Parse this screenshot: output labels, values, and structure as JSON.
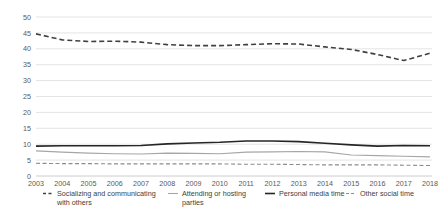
{
  "chart_data": {
    "type": "line",
    "title": "",
    "subtitle": "",
    "xlabel": "",
    "ylabel": "",
    "x": [
      2003,
      2004,
      2005,
      2006,
      2007,
      2008,
      2009,
      2010,
      2011,
      2012,
      2013,
      2014,
      2015,
      2016,
      2017,
      2018
    ],
    "categories": [
      "2003",
      "2004",
      "2005",
      "2006",
      "2007",
      "2008",
      "2009",
      "2010",
      "2011",
      "2012",
      "2013",
      "2014",
      "2015",
      "2016",
      "2017",
      "2018"
    ],
    "xlim": [
      2003,
      2018
    ],
    "ylim": [
      0,
      50
    ],
    "yticks": [
      0,
      5,
      10,
      15,
      20,
      25,
      30,
      35,
      40,
      45,
      50
    ],
    "ytick_labels": [
      "0",
      "5",
      "10",
      "15",
      "20",
      "25",
      "30",
      "35",
      "40",
      "45",
      "50"
    ],
    "grid": true,
    "grid_axis": "y",
    "legend_position": "bottom",
    "series": [
      {
        "name": "Socializing and communicating with others",
        "legend_label_line1": "Socializing and communicating",
        "legend_label_line2": "with others",
        "style": "dashed",
        "color": "#404040",
        "width": 1.6,
        "dash": "5,3",
        "values": [
          44.7,
          42.8,
          42.3,
          42.4,
          42.1,
          41.3,
          41.0,
          41.0,
          41.3,
          41.6,
          41.5,
          40.6,
          39.8,
          38.2,
          36.3,
          38.6
        ]
      },
      {
        "name": "Attending or hosting parties",
        "legend_label_line1": "Attending or hosting",
        "legend_label_line2": "parties",
        "style": "solid",
        "color": "#a6a6a6",
        "width": 1.1,
        "dash": "",
        "values": [
          7.9,
          7.5,
          7.2,
          7.0,
          6.9,
          7.2,
          7.1,
          7.0,
          7.5,
          7.6,
          7.7,
          7.6,
          6.6,
          6.4,
          6.2,
          6.0
        ]
      },
      {
        "name": "Personal media time",
        "legend_label_line1": "Personal media time",
        "legend_label_line2": "",
        "style": "solid",
        "color": "#262626",
        "width": 1.6,
        "dash": "",
        "values": [
          9.4,
          9.5,
          9.5,
          9.5,
          9.6,
          10.1,
          10.4,
          10.6,
          11.0,
          11.0,
          10.8,
          10.3,
          9.8,
          9.4,
          9.6,
          9.5
        ]
      },
      {
        "name": "Other social time",
        "legend_label_line1": "Other social time",
        "legend_label_line2": "",
        "style": "dashed",
        "color": "#8c8c8c",
        "width": 1.1,
        "dash": "4,2.5",
        "values": [
          4.0,
          3.9,
          3.9,
          3.8,
          3.8,
          3.8,
          3.8,
          3.8,
          3.7,
          3.7,
          3.6,
          3.5,
          3.5,
          3.5,
          3.4,
          3.3
        ]
      }
    ]
  }
}
